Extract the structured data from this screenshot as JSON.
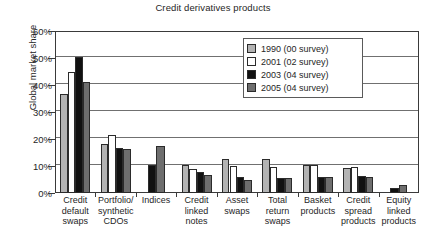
{
  "chart_data": {
    "type": "bar",
    "title": "Credit derivatives products",
    "xlabel": "",
    "ylabel": "Global market share",
    "ylim": [
      0,
      60
    ],
    "ytick_labels": [
      "0%",
      "10%",
      "20%",
      "30%",
      "40%",
      "50%",
      "60%"
    ],
    "ytick_values": [
      0,
      10,
      20,
      30,
      40,
      50,
      60
    ],
    "grid": true,
    "legend_position": "top-right",
    "categories": [
      "Credit default swaps",
      "Portfolio/ synthetic CDOs",
      "Indices",
      "Credit linked notes",
      "Asset swaps",
      "Total return swaps",
      "Basket products",
      "Credit spread products",
      "Equity linked products"
    ],
    "category_lines": [
      [
        "Credit",
        "default",
        "swaps"
      ],
      [
        "Portfolio/",
        "synthetic",
        "CDOs"
      ],
      [
        "Indices"
      ],
      [
        "Credit",
        "linked",
        "notes"
      ],
      [
        "Asset",
        "swaps"
      ],
      [
        "Total",
        "return",
        "swaps"
      ],
      [
        "Basket",
        "products"
      ],
      [
        "Credit",
        "spread",
        "products"
      ],
      [
        "Equity",
        "linked",
        "products"
      ]
    ],
    "series": [
      {
        "name": "1990 (00 survey)",
        "color": "#b3b3b3",
        "values": [
          36.5,
          18.2,
          null,
          10.3,
          12.5,
          12.5,
          10.2,
          9.3,
          null
        ]
      },
      {
        "name": "2001 (02 survey)",
        "color": "#ffffff",
        "values": [
          45.0,
          21.5,
          null,
          9.0,
          10.0,
          9.7,
          10.2,
          9.5,
          null
        ]
      },
      {
        "name": "2003 (04 survey)",
        "color": "#111111",
        "values": [
          50.5,
          16.5,
          10.2,
          7.8,
          6.0,
          5.5,
          6.0,
          6.3,
          2.0
        ]
      },
      {
        "name": "2005 (04 survey)",
        "color": "#6e6e6e",
        "values": [
          41.0,
          16.3,
          17.4,
          6.7,
          5.0,
          5.4,
          5.9,
          6.0,
          3.0
        ]
      }
    ]
  },
  "legend": {
    "items": [
      {
        "label": "1990 (00 survey)",
        "color": "#b3b3b3"
      },
      {
        "label": "2001 (02 survey)",
        "color": "#ffffff"
      },
      {
        "label": "2003 (04 survey)",
        "color": "#111111"
      },
      {
        "label": "2005 (04 survey)",
        "color": "#6e6e6e"
      }
    ]
  }
}
